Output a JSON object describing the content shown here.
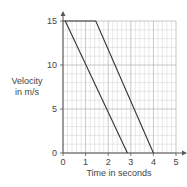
{
  "chart_data": {
    "type": "line",
    "title": "",
    "xlabel": "Time in seconds",
    "ylabel": "Velocity in m/s",
    "ylabel_lines": [
      "Velocity",
      "in m/s"
    ],
    "xlim": [
      0,
      5
    ],
    "ylim": [
      0,
      15
    ],
    "x_ticks": [
      "0",
      "1",
      "2",
      "3",
      "4",
      "5"
    ],
    "y_ticks": [
      "0",
      "5",
      "10",
      "15"
    ],
    "grid": true,
    "grid_minor_step_x": 0.2,
    "grid_minor_step_y": 1,
    "series": [
      {
        "name": "Line A",
        "points": [
          [
            0.1,
            15
          ],
          [
            2.85,
            0
          ]
        ]
      },
      {
        "name": "Line B",
        "points": [
          [
            0,
            15
          ],
          [
            1.45,
            15
          ],
          [
            4,
            0
          ]
        ]
      }
    ],
    "colors": {
      "line": "#333333",
      "grid": "#c8c8c8",
      "axis": "#555555"
    }
  }
}
